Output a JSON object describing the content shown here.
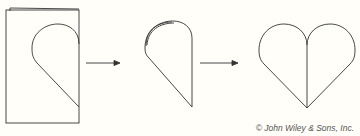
{
  "diagram": {
    "steps": [
      {
        "label": "folded-paper-with-half-heart"
      },
      {
        "label": "cut-half-heart-layers"
      },
      {
        "label": "unfolded-heart"
      }
    ],
    "arrows": 2
  },
  "credit": "© John Wiley & Sons, Inc.",
  "colors": {
    "stroke": "#333333",
    "background": "#fffef9"
  }
}
